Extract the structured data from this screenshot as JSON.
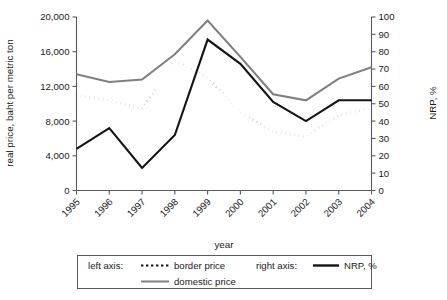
{
  "chart_data": {
    "type": "line",
    "title": "",
    "xlabel": "year",
    "ylabel": "real price, baht per metric ton",
    "y2label": "NRP, %",
    "categories": [
      "1995",
      "1996",
      "1997",
      "1998",
      "1999",
      "2000",
      "2001",
      "2002",
      "2003",
      "2004"
    ],
    "x": [
      1995,
      1996,
      1997,
      1998,
      1999,
      2000,
      2001,
      2002,
      2003,
      2004
    ],
    "ylim": [
      0,
      20000
    ],
    "yticks": [
      0,
      4000,
      8000,
      12000,
      16000,
      20000
    ],
    "ytick_labels": [
      "0",
      "4,000",
      "8,000",
      "12,000",
      "16,000",
      "20,000"
    ],
    "y2lim": [
      0,
      100
    ],
    "y2ticks": [
      0,
      10,
      20,
      30,
      40,
      50,
      60,
      70,
      80,
      90,
      100
    ],
    "y2tick_labels": [
      "0",
      "10",
      "20",
      "30",
      "40",
      "50",
      "60",
      "70",
      "80",
      "90",
      "100"
    ],
    "grid": false,
    "legend_position": "below",
    "series": [
      {
        "name": "border price",
        "axis": "left",
        "style": "dotted",
        "color": "#141414",
        "values": [
          11000,
          10400,
          9400,
          15000,
          13000,
          9000,
          6800,
          6200,
          8700,
          9500
        ]
      },
      {
        "name": "domestic price",
        "axis": "left",
        "style": "solid",
        "color": "#808080",
        "values": [
          13400,
          12500,
          12800,
          15700,
          19600,
          15400,
          11100,
          10400,
          12900,
          14200
        ]
      },
      {
        "name": "NRP, %",
        "axis": "right",
        "style": "solid",
        "color": "#141414",
        "values": [
          24,
          36,
          13,
          32,
          87,
          73,
          51,
          40,
          52,
          52
        ]
      }
    ]
  },
  "legend": {
    "left_axis_label": "left axis:",
    "right_axis_label": "right axis:",
    "entries": [
      {
        "label": "border price",
        "group": "left"
      },
      {
        "label": "domestic price",
        "group": "left"
      },
      {
        "label": "NRP, %",
        "group": "right"
      }
    ]
  },
  "colors": {
    "domestic": "#808080",
    "border": "#141414",
    "nrp": "#141414",
    "axis": "#555b5e",
    "text": "#1a1a1a"
  }
}
